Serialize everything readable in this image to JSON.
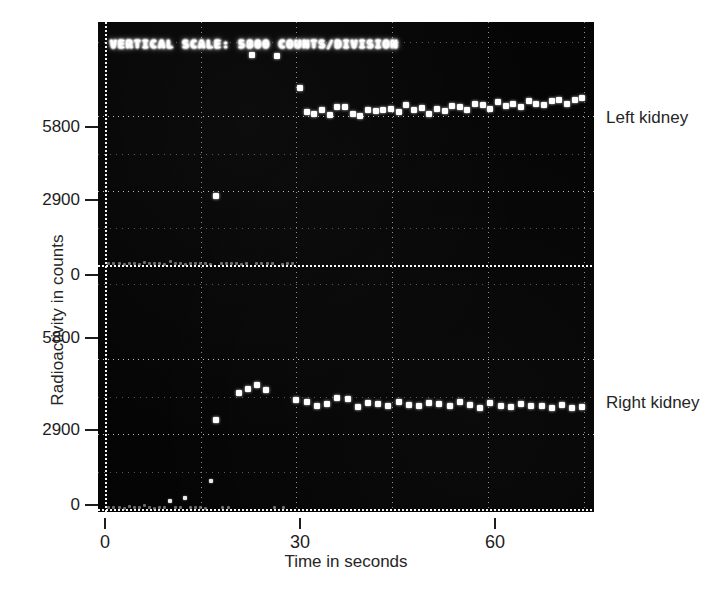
{
  "figure": {
    "crt_header": "VERTICAL SCALE: 5800 COUNTS/DIVISION",
    "xlabel": "Time in seconds",
    "ylabel": "Radioactivity in counts",
    "trace_labels": {
      "upper": "Left kidney",
      "lower": "Right kidney"
    },
    "colors": {
      "panel_background": "#050505",
      "trace_point": "#ffffff",
      "grid": "#e8e8e8",
      "text": "#262626",
      "page_background": "#ffffff"
    }
  },
  "chart_data": {
    "type": "scatter",
    "title": "",
    "subtitle": "",
    "annotations": [
      "VERTICAL SCALE: 5800 COUNTS/DIVISION",
      "Left kidney",
      "Right kidney"
    ],
    "xlabel": "Time in seconds",
    "ylabel": "Radioactivity in counts",
    "xlim": [
      0,
      76
    ],
    "xticks": [
      0,
      30,
      60
    ],
    "xticklabels": [
      "0",
      "30",
      "60"
    ],
    "grid": true,
    "legend_position": "right-outside",
    "panels": [
      {
        "name": "upper",
        "label": "Left kidney",
        "ylim": [
          0,
          8700
        ],
        "yticks": [
          0,
          2900,
          5800
        ],
        "yticklabels": [
          "0",
          "2900",
          "5800"
        ],
        "description": "Left kidney uptake curve; sparse noisy low counts for first ~17 s, isolated high-count transients, then rapid rise at ~30 s to a stable plateau slightly above 5800 counts.",
        "points": [
          {
            "x": 0.6,
            "y": 60
          },
          {
            "x": 1.4,
            "y": 40
          },
          {
            "x": 2.2,
            "y": 55
          },
          {
            "x": 3.0,
            "y": 35
          },
          {
            "x": 3.8,
            "y": 70
          },
          {
            "x": 4.6,
            "y": 45
          },
          {
            "x": 5.4,
            "y": 30
          },
          {
            "x": 6.2,
            "y": 80
          },
          {
            "x": 7.0,
            "y": 50
          },
          {
            "x": 7.8,
            "y": 40
          },
          {
            "x": 8.6,
            "y": 60
          },
          {
            "x": 9.4,
            "y": 35
          },
          {
            "x": 10.2,
            "y": 120
          },
          {
            "x": 11.0,
            "y": 45
          },
          {
            "x": 11.8,
            "y": 55
          },
          {
            "x": 12.6,
            "y": 30
          },
          {
            "x": 13.4,
            "y": 65
          },
          {
            "x": 14.2,
            "y": 40
          },
          {
            "x": 15.0,
            "y": 50
          },
          {
            "x": 15.8,
            "y": 45
          },
          {
            "x": 16.6,
            "y": 35
          },
          {
            "x": 17.4,
            "y": 2700
          },
          {
            "x": 18.2,
            "y": 55
          },
          {
            "x": 19.0,
            "y": 40
          },
          {
            "x": 19.8,
            "y": 70
          },
          {
            "x": 20.6,
            "y": 45
          },
          {
            "x": 21.4,
            "y": 35
          },
          {
            "x": 22.2,
            "y": 60
          },
          {
            "x": 23.0,
            "y": 8200
          },
          {
            "x": 23.8,
            "y": 50
          },
          {
            "x": 24.6,
            "y": 40
          },
          {
            "x": 25.4,
            "y": 55
          },
          {
            "x": 26.2,
            "y": 45
          },
          {
            "x": 27.0,
            "y": 8150
          },
          {
            "x": 27.8,
            "y": 35
          },
          {
            "x": 28.6,
            "y": 60
          },
          {
            "x": 29.4,
            "y": 50
          },
          {
            "x": 30.6,
            "y": 6900
          },
          {
            "x": 31.6,
            "y": 5950
          },
          {
            "x": 32.8,
            "y": 5880
          },
          {
            "x": 34.0,
            "y": 6050
          },
          {
            "x": 35.2,
            "y": 5840
          },
          {
            "x": 36.4,
            "y": 6150
          },
          {
            "x": 37.6,
            "y": 6180
          },
          {
            "x": 38.8,
            "y": 5900
          },
          {
            "x": 40.0,
            "y": 5820
          },
          {
            "x": 41.2,
            "y": 6050
          },
          {
            "x": 42.4,
            "y": 6000
          },
          {
            "x": 43.6,
            "y": 6030
          },
          {
            "x": 44.8,
            "y": 6080
          },
          {
            "x": 46.0,
            "y": 5950
          },
          {
            "x": 47.2,
            "y": 6250
          },
          {
            "x": 48.4,
            "y": 6060
          },
          {
            "x": 49.6,
            "y": 6120
          },
          {
            "x": 50.8,
            "y": 5900
          },
          {
            "x": 52.0,
            "y": 6100
          },
          {
            "x": 53.2,
            "y": 6000
          },
          {
            "x": 54.4,
            "y": 6200
          },
          {
            "x": 55.6,
            "y": 6180
          },
          {
            "x": 56.8,
            "y": 6050
          },
          {
            "x": 58.0,
            "y": 6300
          },
          {
            "x": 59.2,
            "y": 6250
          },
          {
            "x": 60.4,
            "y": 6100
          },
          {
            "x": 61.6,
            "y": 6350
          },
          {
            "x": 62.8,
            "y": 6200
          },
          {
            "x": 64.0,
            "y": 6280
          },
          {
            "x": 65.2,
            "y": 6150
          },
          {
            "x": 66.4,
            "y": 6400
          },
          {
            "x": 67.6,
            "y": 6300
          },
          {
            "x": 68.8,
            "y": 6250
          },
          {
            "x": 70.0,
            "y": 6380
          },
          {
            "x": 71.2,
            "y": 6420
          },
          {
            "x": 72.4,
            "y": 6300
          },
          {
            "x": 73.6,
            "y": 6450
          },
          {
            "x": 74.8,
            "y": 6500
          }
        ]
      },
      {
        "name": "lower",
        "label": "Right kidney",
        "ylim": [
          0,
          8700
        ],
        "yticks": [
          0,
          2900,
          5800
        ],
        "yticklabels": [
          "0",
          "2900",
          "5800"
        ],
        "y_axis_direction": "inverted",
        "description": "Right kidney uptake curve plotted on a downward-mirrored axis; near zero for first ~14 s, steps up at ~17 s, peaks near 4800 counts around 25 s, then settles to a stable plateau near 4000 counts.",
        "points": [
          {
            "x": 0.6,
            "y": 70
          },
          {
            "x": 1.4,
            "y": 45
          },
          {
            "x": 2.2,
            "y": 60
          },
          {
            "x": 3.0,
            "y": 30
          },
          {
            "x": 3.8,
            "y": 80
          },
          {
            "x": 4.6,
            "y": 50
          },
          {
            "x": 5.4,
            "y": 40
          },
          {
            "x": 6.2,
            "y": 120
          },
          {
            "x": 7.0,
            "y": 55
          },
          {
            "x": 7.8,
            "y": 35
          },
          {
            "x": 8.6,
            "y": 65
          },
          {
            "x": 9.4,
            "y": 45
          },
          {
            "x": 10.2,
            "y": 300
          },
          {
            "x": 11.0,
            "y": 60
          },
          {
            "x": 11.8,
            "y": 40
          },
          {
            "x": 12.6,
            "y": 420
          },
          {
            "x": 13.4,
            "y": 50
          },
          {
            "x": 14.2,
            "y": 70
          },
          {
            "x": 15.0,
            "y": 45
          },
          {
            "x": 15.8,
            "y": 35
          },
          {
            "x": 16.6,
            "y": 1100
          },
          {
            "x": 17.4,
            "y": 3450
          },
          {
            "x": 18.4,
            "y": 60
          },
          {
            "x": 19.4,
            "y": 45
          },
          {
            "x": 21.0,
            "y": 4500
          },
          {
            "x": 22.4,
            "y": 4650
          },
          {
            "x": 23.8,
            "y": 4800
          },
          {
            "x": 25.2,
            "y": 4600
          },
          {
            "x": 26.6,
            "y": 55
          },
          {
            "x": 28.0,
            "y": 40
          },
          {
            "x": 30.0,
            "y": 4200
          },
          {
            "x": 31.6,
            "y": 4120
          },
          {
            "x": 33.2,
            "y": 4000
          },
          {
            "x": 34.8,
            "y": 4050
          },
          {
            "x": 36.4,
            "y": 4300
          },
          {
            "x": 38.0,
            "y": 4250
          },
          {
            "x": 39.6,
            "y": 3950
          },
          {
            "x": 41.2,
            "y": 4100
          },
          {
            "x": 42.8,
            "y": 4050
          },
          {
            "x": 44.4,
            "y": 4000
          },
          {
            "x": 46.0,
            "y": 4150
          },
          {
            "x": 47.6,
            "y": 4020
          },
          {
            "x": 49.2,
            "y": 3980
          },
          {
            "x": 50.8,
            "y": 4080
          },
          {
            "x": 52.4,
            "y": 4050
          },
          {
            "x": 54.0,
            "y": 4000
          },
          {
            "x": 55.6,
            "y": 4120
          },
          {
            "x": 57.2,
            "y": 4030
          },
          {
            "x": 58.8,
            "y": 3900
          },
          {
            "x": 60.4,
            "y": 4100
          },
          {
            "x": 62.0,
            "y": 4000
          },
          {
            "x": 63.6,
            "y": 3950
          },
          {
            "x": 65.2,
            "y": 4050
          },
          {
            "x": 66.8,
            "y": 3980
          },
          {
            "x": 68.4,
            "y": 4000
          },
          {
            "x": 70.0,
            "y": 3920
          },
          {
            "x": 71.6,
            "y": 4020
          },
          {
            "x": 73.2,
            "y": 3900
          },
          {
            "x": 74.8,
            "y": 3950
          }
        ]
      }
    ]
  }
}
